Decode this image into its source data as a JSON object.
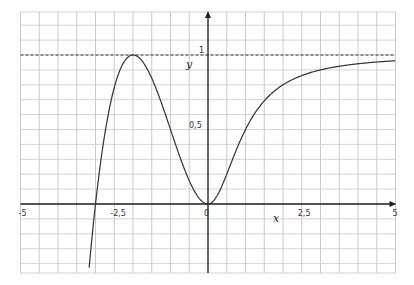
{
  "chart_data": {
    "type": "line",
    "title": "",
    "xlabel": "x",
    "ylabel": "y",
    "xlim": [
      -5,
      5
    ],
    "ylim": [
      -0.46,
      1.28
    ],
    "grid": true,
    "grid_x_step": 0.5,
    "grid_y_step": 0.1,
    "x_ticks": [
      {
        "value": -5,
        "label": "-5"
      },
      {
        "value": -2.5,
        "label": "-2,5"
      },
      {
        "value": 0,
        "label": "0"
      },
      {
        "value": 2.5,
        "label": "2,5"
      },
      {
        "value": 5,
        "label": "5"
      }
    ],
    "y_ticks": [
      {
        "value": 0.5,
        "label": "0,5"
      },
      {
        "value": 1,
        "label": "1"
      }
    ],
    "asymptote": {
      "y": 1,
      "style": "dashed"
    },
    "series": [
      {
        "name": "f(x)",
        "description": "x<0: x^2(x+3)/4 ; x>=0: x^2/(1+x^2)",
        "x": [
          -3.15,
          -3,
          -2.75,
          -2.5,
          -2.25,
          -2,
          -1.75,
          -1.5,
          -1.25,
          -1,
          -0.75,
          -0.5,
          -0.25,
          0,
          0.25,
          0.5,
          0.75,
          1,
          1.5,
          2,
          2.5,
          3,
          3.5,
          4,
          4.5,
          5
        ],
        "y": [
          -0.37,
          0,
          0.43,
          0.78,
          0.95,
          1,
          0.96,
          0.84,
          0.68,
          0.5,
          0.32,
          0.16,
          0.04,
          0,
          0.06,
          0.2,
          0.36,
          0.5,
          0.69,
          0.8,
          0.86,
          0.9,
          0.92,
          0.94,
          0.95,
          0.96
        ]
      }
    ],
    "color": "#333333"
  }
}
